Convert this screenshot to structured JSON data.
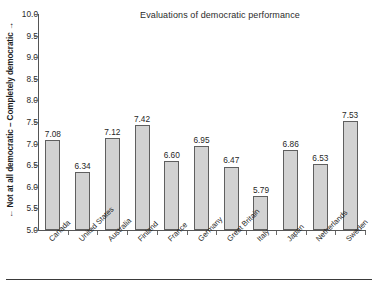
{
  "chart_data": {
    "type": "bar",
    "title": "Evaluations of democratic performance",
    "xlabel": "",
    "ylabel": "← Not at all democratic – Completely democratic →",
    "ylim": [
      5.0,
      10.0
    ],
    "ytick_step": 0.5,
    "grid": false,
    "legend": "none",
    "bar_fill": "#d2d2d2",
    "bar_stroke": "#5f5f5f",
    "categories": [
      "Canada",
      "United States",
      "Australia",
      "Finland",
      "France",
      "Germany",
      "Great Britain",
      "Italy",
      "Japan",
      "Netherlands",
      "Sweden"
    ],
    "values": [
      7.08,
      6.34,
      7.12,
      7.42,
      6.6,
      6.95,
      6.47,
      5.79,
      6.86,
      6.53,
      7.53
    ],
    "value_labels": [
      "7.08",
      "6.34",
      "7.12",
      "7.42",
      "6.60",
      "6.95",
      "6.47",
      "5.79",
      "6.86",
      "6.53",
      "7.53"
    ],
    "ytick_labels": [
      "10.0",
      "9.5",
      "9.0",
      "8.5",
      "8.0",
      "7.5",
      "7.0",
      "6.5",
      "6.0",
      "5.5",
      "5.0"
    ],
    "ytick_values": [
      10.0,
      9.5,
      9.0,
      8.5,
      8.0,
      7.5,
      7.0,
      6.5,
      6.0,
      5.5,
      5.0
    ]
  }
}
